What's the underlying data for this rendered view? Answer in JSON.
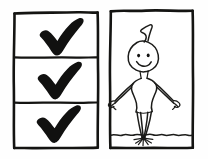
{
  "illustration": {
    "title": "Hand-drawn checklist beside a standing figure",
    "style": "black ink marker sketch on white paper",
    "background_color": "#fefefe",
    "ink_color": "#1a1a18",
    "canvas": {
      "width": 208,
      "height": 159
    }
  },
  "left_panel": {
    "name": "checklist-panel",
    "description": "Tall rectangle divided into three stacked cells",
    "frame_color": "#141412",
    "cells": [
      {
        "index": 1,
        "mark": "check",
        "mark_state": "checked",
        "mark_label": "✔"
      },
      {
        "index": 2,
        "mark": "check",
        "mark_state": "checked",
        "mark_label": "✔"
      },
      {
        "index": 3,
        "mark": "check",
        "mark_state": "checked",
        "mark_label": "✔"
      }
    ],
    "checked_count": 3,
    "total_count": 3
  },
  "right_panel": {
    "name": "figure-panel",
    "description": "Rectangle containing a smiling stick figure standing on a wavy line",
    "frame_color": "#141412",
    "figure": {
      "name": "standing-person",
      "expression": "smiling",
      "hair": "single curl cowlick",
      "eyes": 2,
      "arms": "outstretched downward with open hands",
      "legs": "straight, converging at a single point",
      "stance": "balancing on one point"
    },
    "ground": {
      "name": "wavy-ground-line",
      "style": "wavy horizontal line",
      "splash": "burst of short radiating strokes at the feet"
    }
  }
}
